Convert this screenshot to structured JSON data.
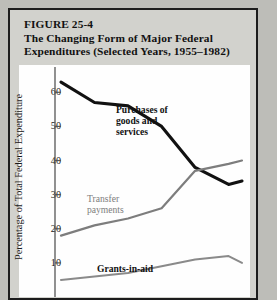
{
  "figure": {
    "caption_line_1": "FIGURE 25-4",
    "caption_line_2": "The Changing Form of Major Federal",
    "caption_line_3": "Expenditures (Selected Years, 1955–1982)"
  },
  "colors": {
    "page_background": "#bdbdb8",
    "figure_background": "#d2d2cd",
    "figure_border": "#1c1c1c",
    "plot_background": "#fefefe",
    "axis": "#555555",
    "purchases_line": "#111111",
    "transfer_line": "#7d7d7d",
    "grants_line": "#8a8a8a",
    "text": "#1a1a1a"
  },
  "chart_data": {
    "type": "line",
    "title": "The Changing Form of Major Federal Expenditures (Selected Years, 1955–1982)",
    "xlabel": "",
    "ylabel": "Percentage of Total Federal Expenditure",
    "ylim": [
      0,
      68
    ],
    "xlim": [
      1955,
      1982
    ],
    "grid": false,
    "legend": "inline-annotations",
    "yticks": [
      60,
      50,
      40,
      30,
      20,
      10
    ],
    "ytick_labels": [
      "60",
      "50",
      "40",
      "30",
      "20",
      "10"
    ],
    "x": [
      1955,
      1960,
      1965,
      1970,
      1975,
      1980,
      1982
    ],
    "series": [
      {
        "name": "Purchases of goods and services",
        "label": "Purchases of\ngoods and\nservices",
        "color": "#111111",
        "values": [
          63,
          57,
          56,
          50,
          38,
          33,
          34
        ]
      },
      {
        "name": "Transfer payments",
        "label": "Transfer\npayments",
        "color": "#7d7d7d",
        "values": [
          18,
          21,
          23,
          26,
          37,
          39,
          40
        ]
      },
      {
        "name": "Grants-in-aid",
        "label": "Grants-in-aid",
        "color": "#8a8a8a",
        "values": [
          5,
          6,
          7,
          9,
          11,
          12,
          10
        ]
      }
    ]
  }
}
